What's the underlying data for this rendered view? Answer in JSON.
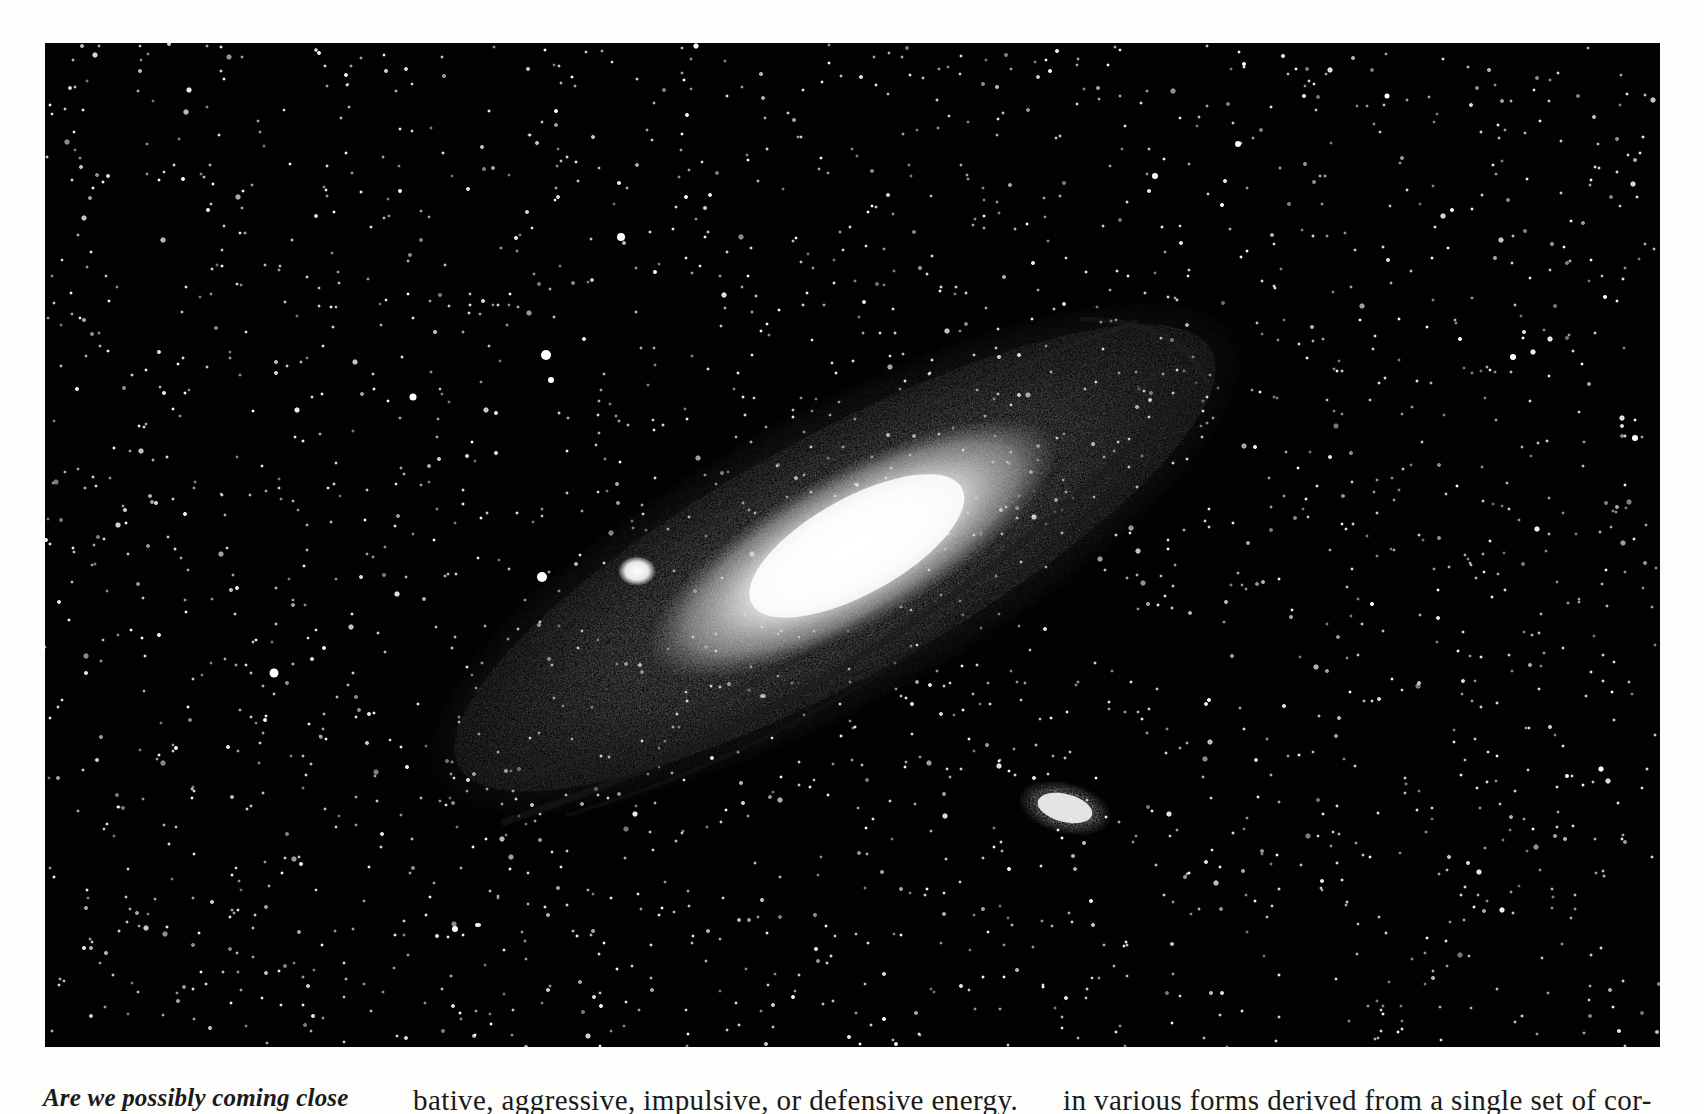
{
  "figure": {
    "colors": {
      "sky": "#020202",
      "core": "#ffffff",
      "disk": "#8a8a8a",
      "page": "#fdfdfb",
      "text": "#1a1a1a"
    }
  },
  "caption": {
    "text": "Are we possibly coming close"
  },
  "body_columns": [
    {
      "text": "bative, aggressive, impulsive, or defensive energy."
    },
    {
      "text": "in various forms derived from a single set of cor-"
    }
  ]
}
